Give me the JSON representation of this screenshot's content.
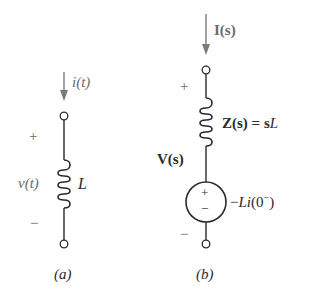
{
  "colors": {
    "wire": "#2a2a2a",
    "arrow": "#7a7a7a",
    "label": "#6a6a6a",
    "background": "#ffffff"
  },
  "circuit_a": {
    "current_label": "i(t)",
    "plus_sign": "+",
    "minus_sign": "−",
    "voltage_label": "v(t)",
    "inductor_label": "L",
    "caption": "(a)"
  },
  "circuit_b": {
    "current_label_bold": "I",
    "current_label_arg": "(s)",
    "plus_sign": "+",
    "minus_sign": "−",
    "voltage_label_bold": "V",
    "voltage_label_arg": "(s)",
    "impedance_label_lhs": "Z(s) = s",
    "impedance_label_L": "L",
    "source_plus": "+",
    "source_minus": "−",
    "source_label_prefix": "−",
    "source_label_Li": "Li",
    "source_label_arg": "(0",
    "source_label_sup": "−",
    "source_label_close": ")",
    "caption": "(b)"
  }
}
